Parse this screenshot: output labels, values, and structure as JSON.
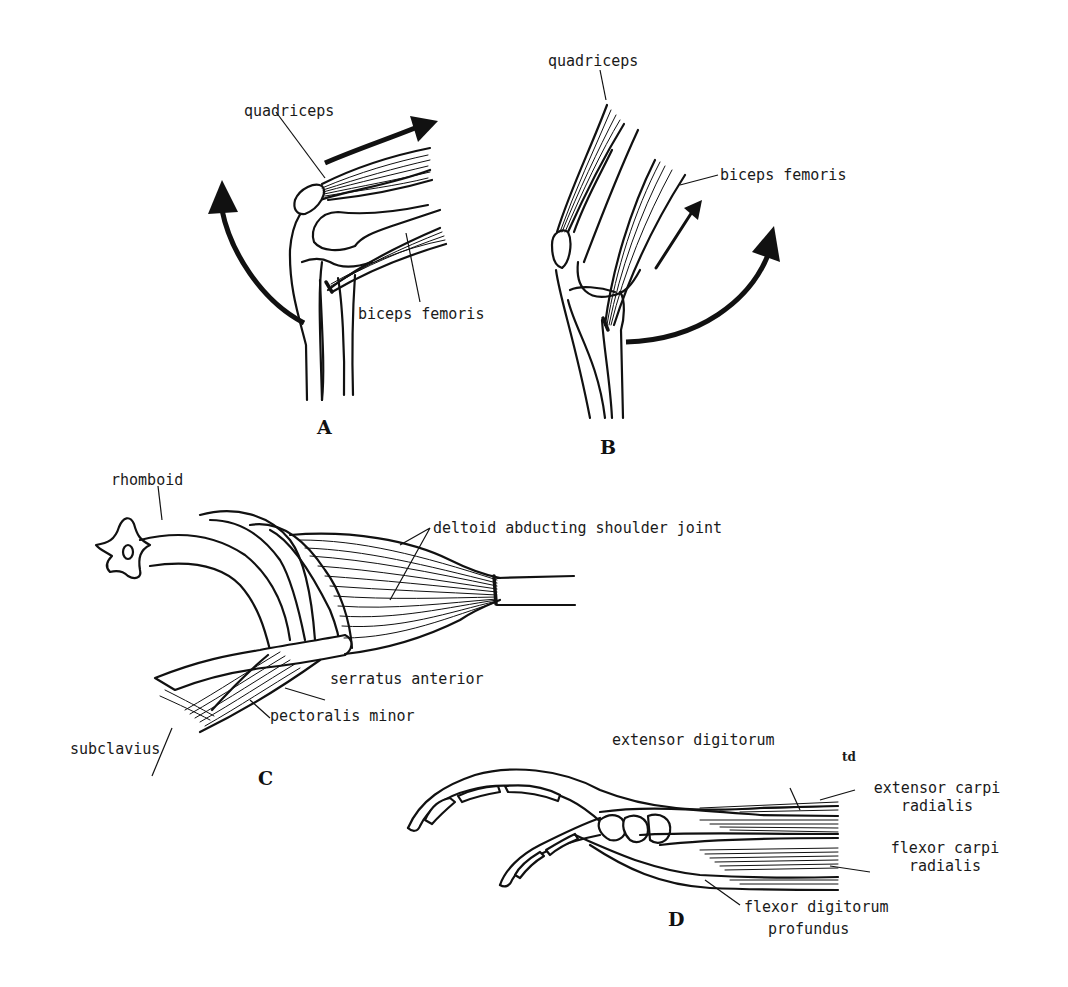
{
  "figure": {
    "panels": [
      {
        "id": "A",
        "panel_label": "A",
        "description": "Knee extension",
        "labels": {
          "quadriceps": "quadriceps",
          "biceps_femoris": "biceps femoris"
        }
      },
      {
        "id": "B",
        "panel_label": "B",
        "description": "Knee flexion",
        "labels": {
          "quadriceps": "quadriceps",
          "biceps_femoris": "biceps femoris"
        }
      },
      {
        "id": "C",
        "panel_label": "C",
        "description": "Shoulder girdle",
        "labels": {
          "rhomboid": "rhomboid",
          "deltoid": "deltoid abducting shoulder joint",
          "serratus": "serratus anterior",
          "pectoralis": "pectoralis minor",
          "subclavius": "subclavius"
        }
      },
      {
        "id": "D",
        "panel_label": "D",
        "description": "Forearm and digit",
        "labels": {
          "extensor_digitorum": "extensor digitorum",
          "td": "td",
          "extensor_carpi_1": "extensor carpi",
          "extensor_carpi_2": "radialis",
          "flexor_carpi_1": "flexor carpi",
          "flexor_carpi_2": "radialis",
          "flexor_digitorum_1": "flexor digitorum",
          "flexor_digitorum_2": "profundus"
        }
      }
    ]
  }
}
